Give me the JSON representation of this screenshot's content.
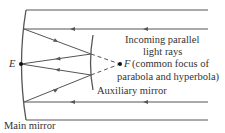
{
  "diagram": {
    "type": "reflecting-telescope-optics",
    "labels": {
      "incoming": "Incoming parallel",
      "incoming2": "light rays",
      "point_e": "E",
      "point_f": "F",
      "focus_desc1": "(common focus of",
      "focus_desc2": "parabola and hyperbola)",
      "aux_mirror": "Auxiliary mirror",
      "main_mirror": "Main mirror"
    },
    "colors": {
      "line": "#555555",
      "text": "#333333",
      "point": "#111111"
    },
    "points": {
      "E": [
        21,
        64
      ],
      "F": [
        120,
        64
      ]
    }
  }
}
